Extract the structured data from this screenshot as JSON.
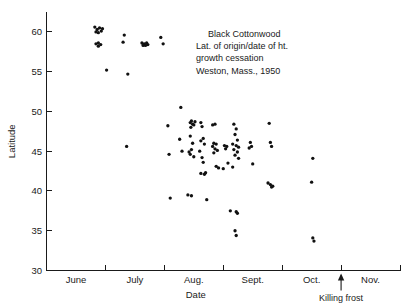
{
  "chart_data": {
    "type": "scatter",
    "title": "",
    "annotation": [
      "Black Cottonwood",
      "Lat. of origin/date of ht.",
      "growth cessation",
      "Weston, Mass., 1950"
    ],
    "xlabel": "Date",
    "ylabel": "Latitude",
    "ylim": [
      30,
      62.5
    ],
    "yticks": [
      30,
      35,
      40,
      45,
      50,
      55,
      60
    ],
    "ytick_labels": [
      "30",
      "35",
      "40",
      "45",
      "50",
      "55",
      "60"
    ],
    "xlim": [
      0,
      6
    ],
    "xtick_positions": [
      0,
      1,
      2,
      3,
      4,
      5,
      6
    ],
    "x_categories": [
      "June",
      "July",
      "Aug.",
      "Sept.",
      "Oct.",
      "Nov."
    ],
    "grid": false,
    "legend": null,
    "marker": "filled-circle",
    "marker_color": "#111111",
    "annotations": [
      {
        "label": "Killing frost",
        "type": "arrow-up",
        "x_month_index": 5.0,
        "note": "arrow at Oct./Nov. boundary"
      }
    ],
    "points": [
      {
        "x": 0.82,
        "y": 60.6
      },
      {
        "x": 0.86,
        "y": 60.3
      },
      {
        "x": 0.9,
        "y": 60.5
      },
      {
        "x": 0.93,
        "y": 60.1
      },
      {
        "x": 0.88,
        "y": 59.9
      },
      {
        "x": 0.95,
        "y": 60.4
      },
      {
        "x": 0.84,
        "y": 60.0
      },
      {
        "x": 0.84,
        "y": 58.5
      },
      {
        "x": 0.88,
        "y": 58.6
      },
      {
        "x": 0.92,
        "y": 58.4
      },
      {
        "x": 0.88,
        "y": 58.2
      },
      {
        "x": 1.02,
        "y": 55.2
      },
      {
        "x": 1.32,
        "y": 59.6
      },
      {
        "x": 1.3,
        "y": 58.7
      },
      {
        "x": 1.38,
        "y": 54.7
      },
      {
        "x": 1.36,
        "y": 45.6
      },
      {
        "x": 1.62,
        "y": 58.6
      },
      {
        "x": 1.66,
        "y": 58.5
      },
      {
        "x": 1.7,
        "y": 58.6
      },
      {
        "x": 1.64,
        "y": 58.3
      },
      {
        "x": 1.68,
        "y": 58.3
      },
      {
        "x": 1.72,
        "y": 58.4
      },
      {
        "x": 1.94,
        "y": 59.3
      },
      {
        "x": 1.98,
        "y": 58.5
      },
      {
        "x": 2.06,
        "y": 48.2
      },
      {
        "x": 2.08,
        "y": 44.6
      },
      {
        "x": 2.1,
        "y": 39.1
      },
      {
        "x": 2.28,
        "y": 50.5
      },
      {
        "x": 2.26,
        "y": 46.5
      },
      {
        "x": 2.3,
        "y": 45.0
      },
      {
        "x": 2.44,
        "y": 48.6
      },
      {
        "x": 2.46,
        "y": 48.8
      },
      {
        "x": 2.48,
        "y": 48.4
      },
      {
        "x": 2.5,
        "y": 48.3
      },
      {
        "x": 2.45,
        "y": 48.0
      },
      {
        "x": 2.52,
        "y": 48.7
      },
      {
        "x": 2.44,
        "y": 46.9
      },
      {
        "x": 2.48,
        "y": 46.0
      },
      {
        "x": 2.46,
        "y": 45.2
      },
      {
        "x": 2.44,
        "y": 44.6
      },
      {
        "x": 2.5,
        "y": 44.3
      },
      {
        "x": 2.42,
        "y": 44.9
      },
      {
        "x": 2.4,
        "y": 39.5
      },
      {
        "x": 2.46,
        "y": 39.4
      },
      {
        "x": 2.62,
        "y": 48.6
      },
      {
        "x": 2.64,
        "y": 48.1
      },
      {
        "x": 2.66,
        "y": 46.6
      },
      {
        "x": 2.62,
        "y": 46.3
      },
      {
        "x": 2.68,
        "y": 45.9
      },
      {
        "x": 2.6,
        "y": 45.0
      },
      {
        "x": 2.64,
        "y": 44.2
      },
      {
        "x": 2.66,
        "y": 43.6
      },
      {
        "x": 2.62,
        "y": 42.2
      },
      {
        "x": 2.68,
        "y": 42.1
      },
      {
        "x": 2.7,
        "y": 42.3
      },
      {
        "x": 2.72,
        "y": 38.9
      },
      {
        "x": 2.82,
        "y": 48.3
      },
      {
        "x": 2.86,
        "y": 48.4
      },
      {
        "x": 2.84,
        "y": 46.0
      },
      {
        "x": 2.88,
        "y": 45.9
      },
      {
        "x": 2.82,
        "y": 45.6
      },
      {
        "x": 2.86,
        "y": 45.3
      },
      {
        "x": 2.9,
        "y": 45.1
      },
      {
        "x": 2.84,
        "y": 44.8
      },
      {
        "x": 2.88,
        "y": 43.1
      },
      {
        "x": 2.92,
        "y": 42.9
      },
      {
        "x": 3.02,
        "y": 45.7
      },
      {
        "x": 3.06,
        "y": 45.6
      },
      {
        "x": 3.04,
        "y": 45.3
      },
      {
        "x": 3.08,
        "y": 43.5
      },
      {
        "x": 3.0,
        "y": 42.8
      },
      {
        "x": 3.18,
        "y": 48.4
      },
      {
        "x": 3.22,
        "y": 47.8
      },
      {
        "x": 3.2,
        "y": 47.1
      },
      {
        "x": 3.24,
        "y": 46.4
      },
      {
        "x": 3.16,
        "y": 45.9
      },
      {
        "x": 3.22,
        "y": 45.7
      },
      {
        "x": 3.26,
        "y": 45.5
      },
      {
        "x": 3.18,
        "y": 45.2
      },
      {
        "x": 3.24,
        "y": 44.9
      },
      {
        "x": 3.2,
        "y": 44.5
      },
      {
        "x": 3.26,
        "y": 44.1
      },
      {
        "x": 3.16,
        "y": 43.0
      },
      {
        "x": 3.12,
        "y": 37.5
      },
      {
        "x": 3.22,
        "y": 37.4
      },
      {
        "x": 3.24,
        "y": 37.2
      },
      {
        "x": 3.2,
        "y": 35.0
      },
      {
        "x": 3.22,
        "y": 34.4
      },
      {
        "x": 3.46,
        "y": 46.1
      },
      {
        "x": 3.48,
        "y": 45.6
      },
      {
        "x": 3.44,
        "y": 45.4
      },
      {
        "x": 3.5,
        "y": 43.4
      },
      {
        "x": 3.78,
        "y": 48.5
      },
      {
        "x": 3.8,
        "y": 46.1
      },
      {
        "x": 3.82,
        "y": 45.6
      },
      {
        "x": 3.76,
        "y": 41.0
      },
      {
        "x": 3.8,
        "y": 40.8
      },
      {
        "x": 3.84,
        "y": 40.6
      },
      {
        "x": 3.82,
        "y": 40.5
      },
      {
        "x": 4.52,
        "y": 44.1
      },
      {
        "x": 4.5,
        "y": 41.1
      },
      {
        "x": 4.52,
        "y": 34.1
      },
      {
        "x": 4.54,
        "y": 33.7
      }
    ]
  },
  "figure": {
    "x_axis_label": "Date",
    "y_axis_label": "Latitude",
    "frost_label": "Killing frost"
  }
}
